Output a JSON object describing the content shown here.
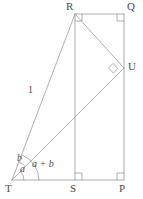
{
  "figure": {
    "type": "geometry-diagram",
    "stroke_color": "#9a9a9a",
    "text_color": "#4d4d4d",
    "background_color": "#ffffff",
    "stroke_width": 0.8,
    "vertices": [
      {
        "id": "R",
        "label": "R",
        "x": 75,
        "y": 14,
        "label_x": 66,
        "label_y": 3
      },
      {
        "id": "Q",
        "label": "Q",
        "x": 124,
        "y": 14,
        "label_x": 127,
        "label_y": 3
      },
      {
        "id": "U",
        "label": "U",
        "x": 124,
        "y": 68,
        "label_x": 128,
        "label_y": 61
      },
      {
        "id": "T",
        "label": "T",
        "x": 12,
        "y": 180,
        "label_x": 6,
        "label_y": 183
      },
      {
        "id": "S",
        "label": "S",
        "x": 75,
        "y": 180,
        "label_x": 71,
        "label_y": 183
      },
      {
        "id": "P",
        "label": "P",
        "x": 124,
        "y": 180,
        "label_x": 120,
        "label_y": 183
      }
    ],
    "segments": [
      {
        "name": "R-Q",
        "from": "R",
        "to": "Q"
      },
      {
        "name": "Q-P",
        "from": "Q",
        "to": "P"
      },
      {
        "name": "T-P",
        "from": "T",
        "to": "P"
      },
      {
        "name": "R-S",
        "from": "R",
        "to": "S"
      },
      {
        "name": "T-R",
        "from": "T",
        "to": "R"
      },
      {
        "name": "T-U",
        "from": "T",
        "to": "U"
      },
      {
        "name": "R-U",
        "from": "R",
        "to": "U"
      }
    ],
    "right_angles": [
      {
        "name": "right-angle-at-R",
        "x": 75,
        "y": 14,
        "orientation": "down-right"
      },
      {
        "name": "right-angle-at-Q",
        "x": 124,
        "y": 14,
        "orientation": "down-left"
      },
      {
        "name": "right-angle-at-S",
        "x": 75,
        "y": 180,
        "orientation": "up-right"
      },
      {
        "name": "right-angle-at-P",
        "x": 124,
        "y": 180,
        "orientation": "up-left"
      },
      {
        "name": "right-angle-at-U",
        "x": 124,
        "y": 68,
        "orientation": "rotated"
      }
    ],
    "labels": [
      {
        "name": "side-length-TR",
        "text": "1",
        "x": 30,
        "y": 88,
        "style": "plain"
      },
      {
        "name": "angle-a",
        "text": "a",
        "x": 20,
        "y": 166,
        "style": "italic"
      },
      {
        "name": "angle-b",
        "text": "b",
        "x": 18,
        "y": 155,
        "style": "italic"
      },
      {
        "name": "angle-sum-a-plus-b",
        "text": "a + b",
        "x": 33,
        "y": 160,
        "style": "italic"
      }
    ],
    "angle_arcs": [
      {
        "name": "arc-angle-a",
        "vertex": "T",
        "radius": 12,
        "from": "baseline",
        "to": "TU"
      },
      {
        "name": "arc-angle-b",
        "vertex": "T",
        "radius": 19,
        "from": "TU",
        "to": "TR"
      },
      {
        "name": "arc-angle-a-plus-b",
        "vertex": "T",
        "radius": 27,
        "from": "baseline",
        "to": "TR"
      }
    ]
  }
}
